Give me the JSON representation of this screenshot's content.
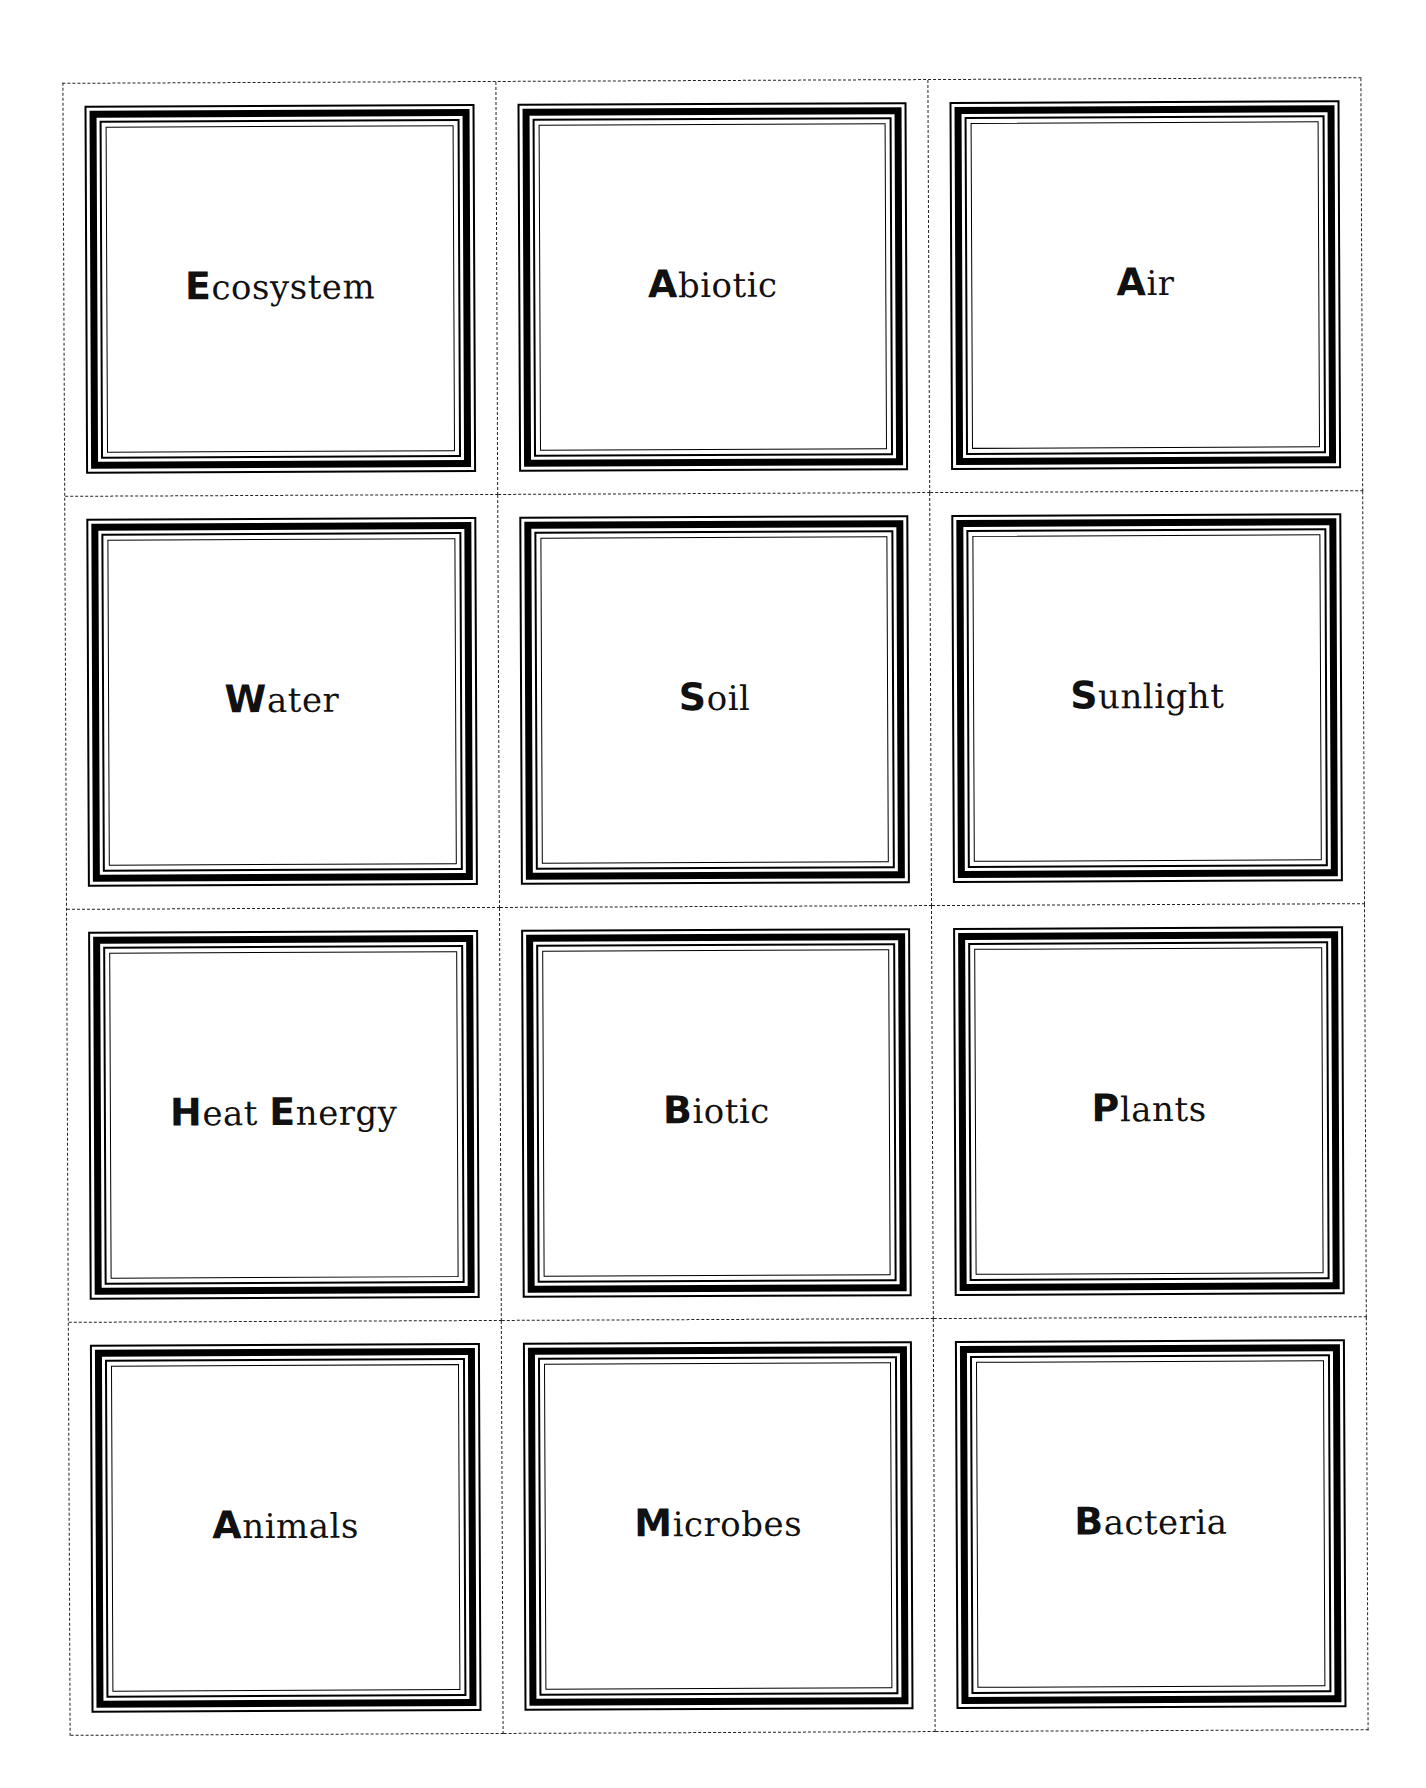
{
  "cards": [
    {
      "initial": "E",
      "rest": "cosystem"
    },
    {
      "initial": "A",
      "rest": "biotic"
    },
    {
      "initial": "A",
      "rest": "ir"
    },
    {
      "initial": "W",
      "rest": "ater"
    },
    {
      "initial": "S",
      "rest": "oil"
    },
    {
      "initial": "S",
      "rest": "unlight"
    },
    {
      "initial": "H",
      "rest": "eat ",
      "initial2": "E",
      "rest2": "nergy"
    },
    {
      "initial": "B",
      "rest": "iotic"
    },
    {
      "initial": "P",
      "rest": "lants"
    },
    {
      "initial": "A",
      "rest": "nimals"
    },
    {
      "initial": "M",
      "rest": "icrobes"
    },
    {
      "initial": "B",
      "rest": "acteria"
    }
  ],
  "labels": [
    "Ecosystem",
    "Abiotic",
    "Air",
    "Water",
    "Soil",
    "Sunlight",
    "Heat Energy",
    "Biotic",
    "Plants",
    "Animals",
    "Microbes",
    "Bacteria"
  ],
  "colors": {
    "ink": "#000000",
    "paper": "#ffffff"
  }
}
